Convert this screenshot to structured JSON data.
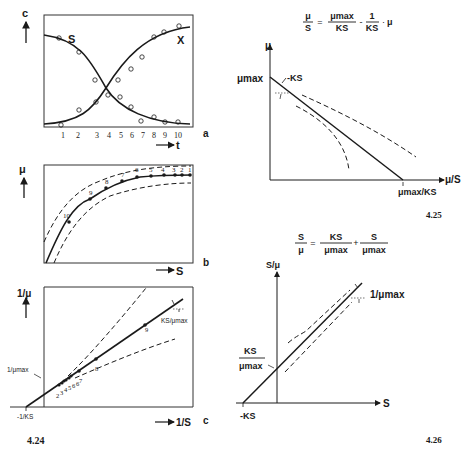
{
  "figure_424": {
    "number": "4.24",
    "panel_a": {
      "label": "a",
      "y_axis": "c",
      "x_axis": "t",
      "x_ticks": [
        "1",
        "2",
        "3",
        "4",
        "5",
        "6",
        "7",
        "8",
        "9",
        "10"
      ],
      "series": [
        {
          "name": "S",
          "description": "substrate concentration decreasing sigmoid"
        },
        {
          "name": "X",
          "description": "biomass concentration increasing sigmoid"
        }
      ]
    },
    "panel_b": {
      "label": "b",
      "y_axis": "μ",
      "x_axis": "S",
      "point_labels": [
        "10",
        "9",
        "8",
        "7",
        "6",
        "5",
        "4",
        "3",
        "2",
        "1"
      ]
    },
    "panel_c": {
      "label": "c",
      "y_axis": "1/μ",
      "x_axis": "1/S",
      "intercept_y": "1/μmax",
      "intercept_x": "-1/KS",
      "slope_label": "KS/μmax",
      "point_labels": [
        "2",
        "3",
        "4",
        "5",
        "6",
        "6",
        "7",
        "8",
        "9"
      ]
    }
  },
  "figure_425": {
    "number": "4.25",
    "equation": {
      "lhs_num": "μ",
      "lhs_den": "S",
      "t1_num": "μmax",
      "t1_den": "KS",
      "t2_num": "1",
      "t2_den": "KS",
      "t2_factor": "μ"
    },
    "y_axis": "μ",
    "x_axis": "μ/S",
    "y_intercept": "μmax",
    "slope_label": "-KS",
    "x_intercept": "μmax/KS"
  },
  "figure_426": {
    "number": "4.26",
    "equation": {
      "lhs_num": "S",
      "lhs_den": "μ",
      "t1_num": "KS",
      "t1_den": "μmax",
      "t2_num": "S",
      "t2_den": "μmax"
    },
    "y_axis": "S/μ",
    "x_axis": "S",
    "y_intercept_num": "KS",
    "y_intercept_den": "μmax",
    "x_intercept": "-KS",
    "slope_label": "1/μmax"
  }
}
